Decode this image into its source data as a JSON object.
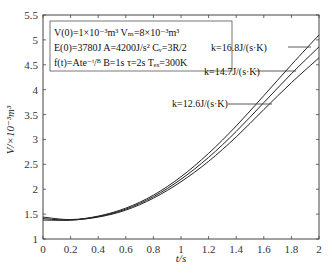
{
  "chart_data": {
    "type": "line",
    "title": "",
    "xlabel": "t/s",
    "ylabel": "V/×10⁻³m³",
    "xlim": [
      0,
      2
    ],
    "ylim": [
      1,
      5.5
    ],
    "xticks": [
      "0",
      "0.2",
      "0.4",
      "0.6",
      "0.8",
      "1",
      "1.2",
      "1.4",
      "1.6",
      "1.8",
      "2"
    ],
    "yticks": [
      "1",
      "1.5",
      "2",
      "2.5",
      "3",
      "3.5",
      "4",
      "4.5",
      "5",
      "5.5"
    ],
    "grid": false,
    "x": [
      0,
      0.2,
      0.4,
      0.6,
      0.8,
      1.0,
      1.2,
      1.4,
      1.6,
      1.8,
      2.0
    ],
    "series": [
      {
        "name": "k=16.8J/(s·K)",
        "values": [
          1.44,
          1.39,
          1.46,
          1.62,
          1.88,
          2.25,
          2.72,
          3.27,
          3.88,
          4.5,
          5.1
        ]
      },
      {
        "name": "k=14.7J/(s·K)",
        "values": [
          1.41,
          1.38,
          1.45,
          1.6,
          1.85,
          2.2,
          2.64,
          3.16,
          3.74,
          4.32,
          4.86
        ]
      },
      {
        "name": "k=12.6J/(s·K)",
        "values": [
          1.38,
          1.38,
          1.44,
          1.58,
          1.82,
          2.15,
          2.56,
          3.05,
          3.6,
          4.14,
          4.64
        ]
      }
    ],
    "annotations": {
      "params_line1": "V(0)=1×10⁻³m³   Vₘ=8×10⁻³m³",
      "params_line2": "E(0)=3780J   A=4200J/s²   Cᵥ=3R/2",
      "params_line3": "f(t)=Ate⁻ᵗ/ᴮ   B=1s   τ=2s   Tₑₓ=300K",
      "k1": "k=16.8J/(s·K)",
      "k2": "k=14.7J/(s·K)",
      "k3": "k=12.6J/(s·K)"
    },
    "line_color": "#222222"
  }
}
